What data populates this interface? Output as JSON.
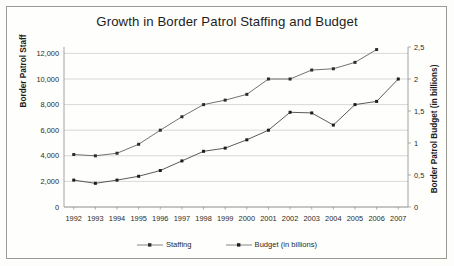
{
  "chart_data": {
    "type": "line",
    "title": "Growth in Border Patrol Staffing and Budget",
    "xlabel": "",
    "ylabel": "Border Patrol Staff",
    "y2label": "Border Patrol Budget (in billions)",
    "categories": [
      "1992",
      "1993",
      "1994",
      "1995",
      "1996",
      "1997",
      "1998",
      "1999",
      "2000",
      "2001",
      "2002",
      "2003",
      "2004",
      "2005",
      "2006",
      "2007"
    ],
    "ylim": [
      0,
      12500
    ],
    "y2lim": [
      0,
      2.5
    ],
    "ytick_labels": [
      "0",
      "2,000",
      "4,000",
      "6,000",
      "8,000",
      "10,000",
      "12,000"
    ],
    "ytick_values": [
      0,
      2000,
      4000,
      6000,
      8000,
      10000,
      12000
    ],
    "y2tick_labels": [
      "0",
      "0,5",
      "1",
      "1,5",
      "2",
      "2,5"
    ],
    "y2tick_values": [
      0,
      0.5,
      1,
      1.5,
      2,
      2.5
    ],
    "grid": true,
    "legend_position": "bottom",
    "series": [
      {
        "name": "Staffing",
        "axis": "left",
        "marker": "square",
        "color": "#59595b",
        "values": [
          4100,
          4000,
          4200,
          4900,
          6000,
          7050,
          8000,
          8350,
          8800,
          10000,
          10000,
          10700,
          10800,
          11300,
          12300,
          null
        ]
      },
      {
        "name": "Budget (in billions)",
        "axis": "right",
        "marker": "square",
        "color": "#3c3c3e",
        "values": [
          0.42,
          0.37,
          0.42,
          0.48,
          0.57,
          0.72,
          0.87,
          0.92,
          1.05,
          1.2,
          1.48,
          1.47,
          1.28,
          1.6,
          1.65,
          2.0
        ]
      }
    ]
  },
  "legend": {
    "items": [
      {
        "label": "Staffing"
      },
      {
        "label": "Budget (in billions)"
      }
    ]
  }
}
